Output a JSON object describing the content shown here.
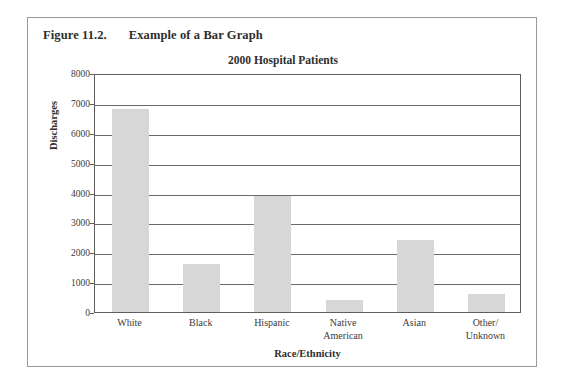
{
  "figure": {
    "number": "Figure 11.2.",
    "caption": "Example of a Bar Graph",
    "border_color": "#9a9a9a"
  },
  "chart_data": {
    "type": "bar",
    "title": "2000 Hospital Patients",
    "xlabel": "Race/Ethnicity",
    "ylabel": "Discharges",
    "categories": [
      "White",
      "Black",
      "Hispanic",
      "Native\nAmerican",
      "Asian",
      "Other/\nUnknown"
    ],
    "category_labels": [
      [
        "White"
      ],
      [
        "Black"
      ],
      [
        "Hispanic"
      ],
      [
        "Native",
        "American"
      ],
      [
        "Asian"
      ],
      [
        "Other/",
        "Unknown"
      ]
    ],
    "values": [
      6800,
      1600,
      3900,
      400,
      2400,
      600
    ],
    "ylim": [
      0,
      8000
    ],
    "yticks": [
      0,
      1000,
      2000,
      3000,
      4000,
      5000,
      6000,
      7000,
      8000
    ],
    "ytick_labels": [
      "0",
      "1000",
      "2000",
      "3000",
      "4000",
      "5000",
      "6000",
      "7000",
      "8000"
    ],
    "grid": true,
    "grid_axis": "y",
    "legend": false,
    "bar_color": "#d7d7d7",
    "axis_color": "#5d5d5d",
    "bar_width_ratio": 0.52
  }
}
